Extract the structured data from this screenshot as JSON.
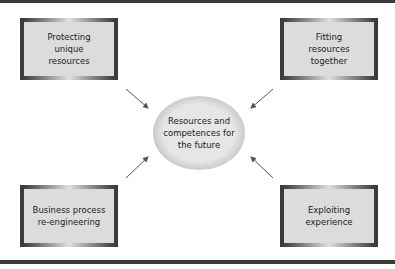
{
  "diagram": {
    "center": {
      "label": "Resources and competences for the future",
      "lines": [
        "Resources and",
        "competences for",
        "the future"
      ]
    },
    "nodes": [
      {
        "id": "top-left",
        "lines": [
          "Protecting",
          "unique",
          "resources"
        ]
      },
      {
        "id": "top-right",
        "lines": [
          "Fitting",
          "resources",
          "together"
        ]
      },
      {
        "id": "bottom-left",
        "lines": [
          "Business process",
          "re-engineering"
        ]
      },
      {
        "id": "bottom-right",
        "lines": [
          "Exploiting",
          "experience"
        ]
      }
    ],
    "edges": [
      {
        "from": "top-left",
        "to": "center"
      },
      {
        "from": "top-right",
        "to": "center"
      },
      {
        "from": "bottom-left",
        "to": "center"
      },
      {
        "from": "bottom-right",
        "to": "center"
      }
    ],
    "colors": {
      "frame": "#3a3a3a",
      "fill": "#dcdcdc",
      "arrow": "#555555"
    }
  }
}
